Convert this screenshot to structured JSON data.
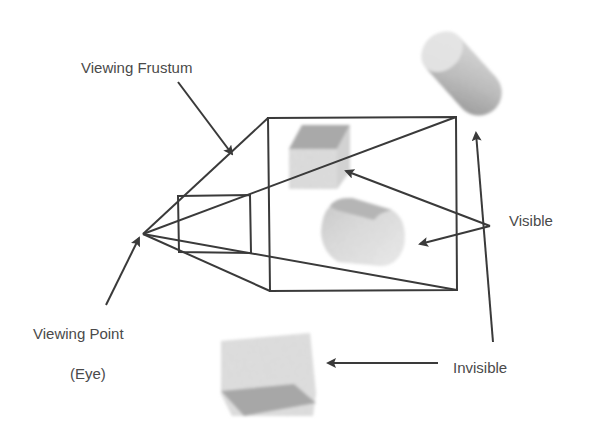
{
  "diagram": {
    "labels": {
      "frustum": "Viewing Frustum",
      "viewing_point": "Viewing Point",
      "eye": "(Eye)",
      "visible": "Visible",
      "invisible": "Invisible"
    },
    "colors": {
      "line": "#3a3a3a",
      "text": "#4a4a4a",
      "object_light": "#d8d8d8",
      "object_dark": "#9a9a9a",
      "background": "#ffffff"
    },
    "geometry": {
      "eye": [
        143,
        234
      ],
      "near_plane": {
        "x1": 178,
        "y1": 196,
        "x2": 251,
        "y2": 253
      },
      "far_plane": {
        "x1": 268,
        "y1": 118,
        "x2": 457,
        "y2": 291
      }
    },
    "objects": [
      {
        "name": "visible-cube",
        "status": "visible",
        "shape": "cube"
      },
      {
        "name": "visible-cylinder",
        "status": "visible",
        "shape": "cylinder"
      },
      {
        "name": "invisible-cylinder",
        "status": "invisible",
        "shape": "cylinder"
      },
      {
        "name": "invisible-cube",
        "status": "invisible",
        "shape": "cube"
      }
    ]
  }
}
